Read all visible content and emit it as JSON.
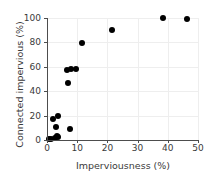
{
  "chart_data": {
    "type": "scatter",
    "title": "",
    "xlabel": "Imperviousness (%)",
    "ylabel": "Connected impervious (%)",
    "xlim": [
      0,
      50
    ],
    "ylim": [
      0,
      100
    ],
    "xticks": [
      0,
      10,
      20,
      30,
      40,
      50
    ],
    "yticks": [
      0,
      20,
      40,
      60,
      80,
      100
    ],
    "grid": true,
    "legend": null,
    "marker": {
      "shape": "circle",
      "color": "#000000",
      "size": 6
    },
    "points": [
      {
        "x": 0.6,
        "y": 1.0
      },
      {
        "x": 1.2,
        "y": 0.8
      },
      {
        "x": 1.9,
        "y": 17.0
      },
      {
        "x": 2.6,
        "y": 1.5
      },
      {
        "x": 3.0,
        "y": 11.0
      },
      {
        "x": 3.4,
        "y": 3.0
      },
      {
        "x": 3.5,
        "y": 20.0
      },
      {
        "x": 3.8,
        "y": 2.5
      },
      {
        "x": 6.5,
        "y": 57.0
      },
      {
        "x": 7.0,
        "y": 47.0
      },
      {
        "x": 7.5,
        "y": 9.0
      },
      {
        "x": 8.0,
        "y": 58.0
      },
      {
        "x": 9.5,
        "y": 58.0
      },
      {
        "x": 11.5,
        "y": 79.5
      },
      {
        "x": 21.5,
        "y": 90.0
      },
      {
        "x": 38.5,
        "y": 100.0
      },
      {
        "x": 46.5,
        "y": 99.5
      }
    ]
  }
}
